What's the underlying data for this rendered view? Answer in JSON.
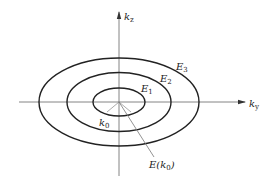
{
  "diagram": {
    "type": "constant-energy contours in k-space",
    "axes": {
      "vertical": {
        "label": "k",
        "subscript": "z"
      },
      "horizontal": {
        "label": "k",
        "subscript": "y"
      }
    },
    "contours": [
      {
        "label": "E",
        "subscript": "1",
        "order": "inner"
      },
      {
        "label": "E",
        "subscript": "2",
        "order": "middle"
      },
      {
        "label": "E",
        "subscript": "3",
        "order": "outer"
      }
    ],
    "annotations": {
      "center_point": {
        "label": "k",
        "subscript": "0"
      },
      "center_energy": {
        "prefix": "E(",
        "label": "k",
        "subscript": "0",
        "suffix": ")"
      }
    },
    "colors": {
      "curve": "#222222",
      "axis": "#555555",
      "leader": "#777777"
    }
  }
}
